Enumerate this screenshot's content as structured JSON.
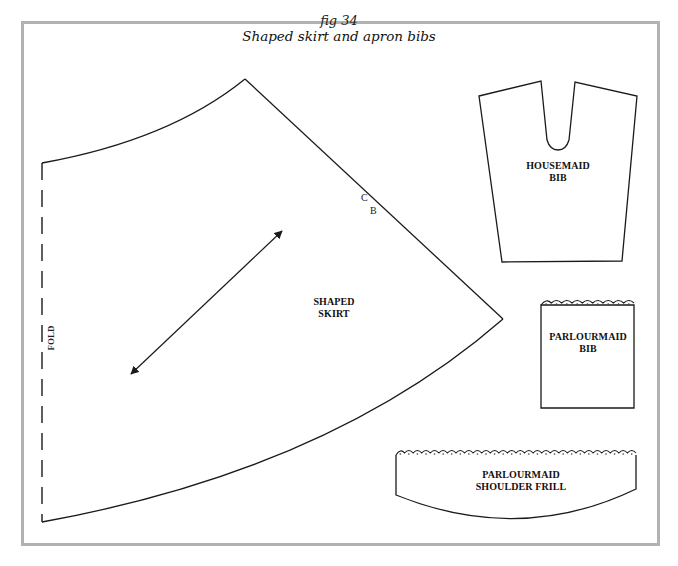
{
  "figure": {
    "number_label": "fig 34",
    "title": "Shaped skirt and apron bibs"
  },
  "pieces": {
    "shaped_skirt": {
      "label_line1": "SHAPED",
      "label_line2": "SKIRT",
      "fold_label": "FOLD",
      "mark_c": "C",
      "mark_b": "B"
    },
    "housemaid_bib": {
      "label_line1": "HOUSEMAID",
      "label_line2": "BIB"
    },
    "parlourmaid_bib": {
      "label_line1": "PARLOURMAID",
      "label_line2": "BIB"
    },
    "parlourmaid_shoulder_frill": {
      "label_line1": "PARLOURMAID",
      "label_line2": "SHOULDER FRILL"
    }
  },
  "colors": {
    "frame": "#b2b2b2",
    "outline": "#1a1a1a"
  }
}
